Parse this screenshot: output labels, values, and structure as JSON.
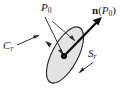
{
  "figure": {
    "name": "normal-vector-on-disk-diagram",
    "background_color": "#ffffff",
    "labels": {
      "point_p0": {
        "symbol": "P",
        "subscript": "0",
        "full_text": "P0",
        "role": "center point of disk"
      },
      "normal_vector": {
        "symbol": "n",
        "argument_open": "(",
        "argument_symbol": "P",
        "argument_subscript": "0",
        "argument_close": ")",
        "full_text": "n(P0)",
        "role": "unit normal vector at P0"
      },
      "boundary_curve": {
        "symbol": "C",
        "subscript": "r",
        "full_text": "Cr",
        "role": "boundary circle of radius r"
      },
      "surface": {
        "symbol": "S",
        "subscript": "r",
        "full_text": "Sr",
        "role": "disk surface of radius r"
      }
    },
    "colors": {
      "disk_fill": "#e3e3e3",
      "disk_outline": "#2b2b2b",
      "vector_stroke": "#111111",
      "leader_stroke": "#2b2b2b",
      "point_marker": "#111111",
      "text": "#1a1a1a"
    },
    "geometry": {
      "disk_center_x": 65,
      "disk_center_y": 55,
      "disk_semi_major": 31,
      "disk_semi_minor": 13,
      "disk_rotation_degrees": -62,
      "point_marker_x": 64,
      "point_marker_y": 56,
      "point_marker_radius": 3.1,
      "normal_tip_x": 102,
      "normal_tip_y": 17
    }
  }
}
